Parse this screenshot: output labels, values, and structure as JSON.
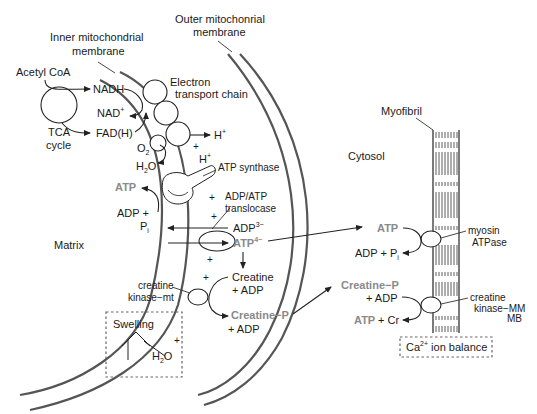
{
  "diagram": {
    "regions": {
      "matrix": "Matrix",
      "cytosol": "Cytosol"
    },
    "structures": {
      "inner_membrane_line1": "Inner mitochondrial",
      "inner_membrane_line2": "membrane",
      "outer_membrane_line1": "Outer mitochonrial",
      "outer_membrane_line2": "membrane",
      "myofibril": "Myofibril",
      "etc_line1": "Electron",
      "etc_line2": "transport chain",
      "atp_synthase": "ATP synthase",
      "translocase_line1": "ADP/ATP",
      "translocase_line2": "translocase",
      "ck_mt_line1": "creatine",
      "ck_mt_line2": "kinase−mt",
      "myosin_line1": "myosin",
      "myosin_line2": "ATPase",
      "ck_mm_line1": "creatine",
      "ck_mm_line2": "kinase−MM",
      "ck_mm_line3": "MB"
    },
    "tca": {
      "acetyl_coa": "Acetyl CoA",
      "tca_line1": "TCA",
      "tca_line2": "cycle",
      "nadh": "NADH",
      "nad": "NAD",
      "nad_sup": "+",
      "fadh": "FAD(H)"
    },
    "etc_products": {
      "o2": "O",
      "o2_sub": "2",
      "h2o_h": "H",
      "h2o_sub": "2",
      "h2o_o": "O",
      "h_plus_1": "H",
      "h_plus_1_sup": "+",
      "h_plus_2": "H",
      "h_plus_2_sup": "+"
    },
    "matrix_reactions": {
      "atp": "ATP",
      "adp_plus": "ADP +",
      "pi": "P",
      "pi_sub": "i"
    },
    "intermembrane": {
      "adp3": "ADP",
      "adp3_sup": "3−",
      "atp4": "ATP",
      "atp4_sup": "4−",
      "creatine": "Creatine",
      "plus_adp_1": "+ ADP",
      "creatine_p": "Creatine−P",
      "plus_adp_2": "+ ADP",
      "plus_signs": [
        "+",
        "+",
        "+",
        "+",
        "+",
        "+"
      ]
    },
    "cytosol_reactions": {
      "atp": "ATP",
      "adp_pi": "ADP + P",
      "adp_pi_sub": "i",
      "creatine_p": "Creatine−P",
      "plus_adp": "+ ADP",
      "atp2": "ATP",
      "plus_cr": "+ Cr"
    },
    "boxes": {
      "swelling": "Swelling",
      "h2o_h": "H",
      "h2o_sub": "2",
      "h2o_o": "O",
      "swelling_plus": "+",
      "ca_ion": "Ca",
      "ca_sup": "2+",
      "ca_rest": " ion balance"
    },
    "colors": {
      "highlight_gray": "#8a8a8a",
      "membrane": "#555555",
      "text": "#1a1a1a"
    }
  }
}
